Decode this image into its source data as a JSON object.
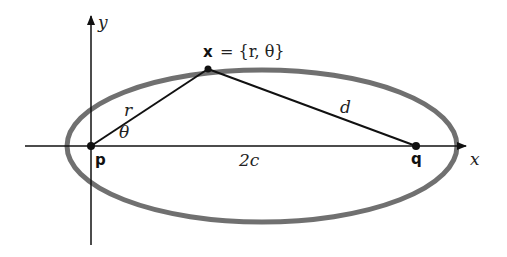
{
  "diagram": {
    "axes": {
      "x_label": "x",
      "y_label": "y"
    },
    "points": {
      "focus_p": "p",
      "focus_q": "q",
      "point_x": "x"
    },
    "point_x_equation": "= {r,  θ}",
    "labels": {
      "r": "r",
      "theta": "θ",
      "d": "d",
      "focal_distance": "2c"
    },
    "colors": {
      "ellipse": "#707070",
      "lines": "#111111"
    }
  }
}
